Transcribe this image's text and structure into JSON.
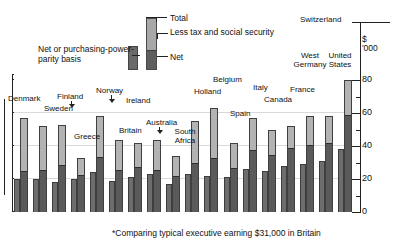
{
  "legend": {
    "total_label": "Total",
    "less_tax_label": "Less tax and social security",
    "net_label": "Net",
    "ppp_caption": "Net or purchasing-power-parity basis"
  },
  "axis": {
    "unit_currency": "$",
    "unit_thousands": "'000",
    "ticks": [
      "80",
      "60",
      "40",
      "20",
      "0"
    ],
    "tick_values": [
      80,
      60,
      40,
      20,
      0
    ]
  },
  "footnote": "*Comparing typical executive earning $31,000 in Britain",
  "colors": {
    "total_fill": "#b3b3b3",
    "net_fill": "#5a5a5a",
    "ppp_fill": "#6d6d6d",
    "outline": "#3d3d3d",
    "gridline": "#d9d9d9"
  },
  "chart_data": {
    "type": "bar",
    "title": "",
    "subtitle": "",
    "xlabel": "",
    "ylabel": "$'000",
    "ylim": [
      0,
      85
    ],
    "grid": true,
    "legend_position": "top-center",
    "note": "Each country shows two bars: left = net pay on purchasing-power-parity basis; right = gross total pay split into net (dark, lower) and tax & social security (light, upper).",
    "categories": [
      "Denmark",
      "Sweden",
      "Finland",
      "Greece",
      "Norway",
      "Ireland",
      "Britain",
      "Australia",
      "South Africa",
      "Holland",
      "Belgium",
      "Spain",
      "Italy",
      "Canada",
      "France",
      "West Germany",
      "United States",
      "Switzerland"
    ],
    "series": [
      {
        "name": "Net or purchasing-power-parity basis",
        "values": [
          20,
          20,
          18,
          20,
          24,
          19,
          21,
          23,
          17,
          23,
          22,
          21,
          26,
          25,
          28,
          29,
          31,
          38
        ]
      },
      {
        "name": "Net",
        "values": [
          24,
          25,
          28,
          22,
          33,
          25,
          27,
          25,
          21,
          29,
          32,
          26,
          37,
          34,
          38,
          40,
          41,
          58
        ]
      },
      {
        "name": "Total",
        "values": [
          57,
          52,
          53,
          33,
          58,
          44,
          42,
          44,
          34,
          55,
          63,
          42,
          57,
          50,
          52,
          58,
          58,
          80
        ]
      }
    ]
  },
  "labels": [
    {
      "text": "Denmark",
      "kind": "bracket"
    },
    {
      "text": "Sweden",
      "kind": "plain"
    },
    {
      "text": "Finland",
      "kind": "arrow"
    },
    {
      "text": "Greece",
      "kind": "plain"
    },
    {
      "text": "Norway",
      "kind": "arrow"
    },
    {
      "text": "Ireland",
      "kind": "plain"
    },
    {
      "text": "Britain",
      "kind": "plain"
    },
    {
      "text": "Australia",
      "kind": "arrow"
    },
    {
      "text": "South Africa",
      "kind": "plain"
    },
    {
      "text": "Holland",
      "kind": "plain"
    },
    {
      "text": "Belgium",
      "kind": "plain"
    },
    {
      "text": "Spain",
      "kind": "plain"
    },
    {
      "text": "Italy",
      "kind": "plain"
    },
    {
      "text": "Canada",
      "kind": "plain"
    },
    {
      "text": "France",
      "kind": "plain"
    },
    {
      "text": "West Germany",
      "kind": "plain"
    },
    {
      "text": "United States",
      "kind": "plain"
    },
    {
      "text": "Switzerland",
      "kind": "plain"
    }
  ]
}
